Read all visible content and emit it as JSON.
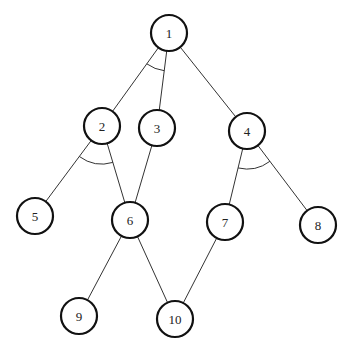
{
  "diagram": {
    "type": "and-or-graph",
    "nodes": [
      {
        "id": "1",
        "label": "1",
        "x": 169,
        "y": 33
      },
      {
        "id": "2",
        "label": "2",
        "x": 102,
        "y": 126
      },
      {
        "id": "3",
        "label": "3",
        "x": 157,
        "y": 128
      },
      {
        "id": "4",
        "label": "4",
        "x": 247,
        "y": 131
      },
      {
        "id": "5",
        "label": "5",
        "x": 35,
        "y": 216
      },
      {
        "id": "6",
        "label": "6",
        "x": 130,
        "y": 220
      },
      {
        "id": "7",
        "label": "7",
        "x": 225,
        "y": 222
      },
      {
        "id": "8",
        "label": "8",
        "x": 318,
        "y": 225
      },
      {
        "id": "9",
        "label": "9",
        "x": 79,
        "y": 316
      },
      {
        "id": "10",
        "label": "10",
        "x": 175,
        "y": 319
      }
    ],
    "edges": [
      {
        "from": "1",
        "to": "2"
      },
      {
        "from": "1",
        "to": "3"
      },
      {
        "from": "1",
        "to": "4"
      },
      {
        "from": "2",
        "to": "5"
      },
      {
        "from": "2",
        "to": "6"
      },
      {
        "from": "3",
        "to": "6"
      },
      {
        "from": "4",
        "to": "7"
      },
      {
        "from": "4",
        "to": "8"
      },
      {
        "from": "6",
        "to": "9"
      },
      {
        "from": "6",
        "to": "10"
      },
      {
        "from": "7",
        "to": "10"
      }
    ],
    "and_arcs": [
      {
        "at": "1",
        "edges": [
          "1-2",
          "1-3"
        ]
      },
      {
        "at": "2",
        "edges": [
          "2-5",
          "2-6"
        ]
      },
      {
        "at": "4",
        "edges": [
          "4-7",
          "4-8"
        ]
      }
    ]
  }
}
